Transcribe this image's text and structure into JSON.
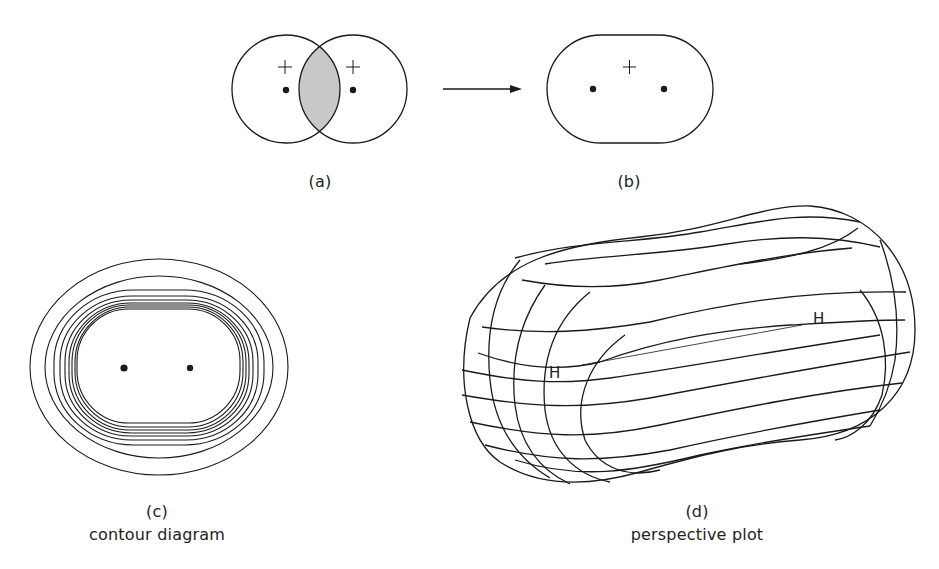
{
  "figure": {
    "panels": [
      {
        "id": "a",
        "label": "(a)",
        "caption": "",
        "description": "Two overlapping circles with shaded overlap region, a nucleus dot and '+' sign in each"
      },
      {
        "id": "b",
        "label": "(b)",
        "caption": "",
        "description": "Single merged stadium-shaped orbital with two nucleus dots and one '+' sign"
      },
      {
        "id": "c",
        "label": "(c)",
        "caption": "contour diagram",
        "description": "Nested contour lines around two nuclei"
      },
      {
        "id": "d",
        "label": "(d)",
        "caption": "perspective plot",
        "description": "3D perspective wireframe plot of the bonding orbital"
      }
    ],
    "symbols": {
      "plus": "+",
      "atom_label": "H"
    },
    "arrow": {
      "from": "a",
      "to": "b"
    },
    "colors": {
      "line": "#1a1a1a",
      "overlap_shade": "#c8c8c8",
      "background": "#ffffff"
    }
  }
}
